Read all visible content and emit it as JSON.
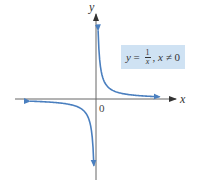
{
  "diagram": {
    "axes": {
      "x_label": "x",
      "y_label": "y",
      "origin_label": "0"
    },
    "equation": {
      "lhs": "y",
      "equals": "=",
      "numerator": "1",
      "denominator": "x",
      "separator": ",",
      "condition_var": "x",
      "condition_op": "≠",
      "condition_value": "0"
    },
    "function": "y = 1/x",
    "domain_restriction": "x ≠ 0",
    "colors": {
      "curve": "#4a7fbf",
      "axes": "#555555",
      "label_box": "#cfe2f3"
    }
  }
}
